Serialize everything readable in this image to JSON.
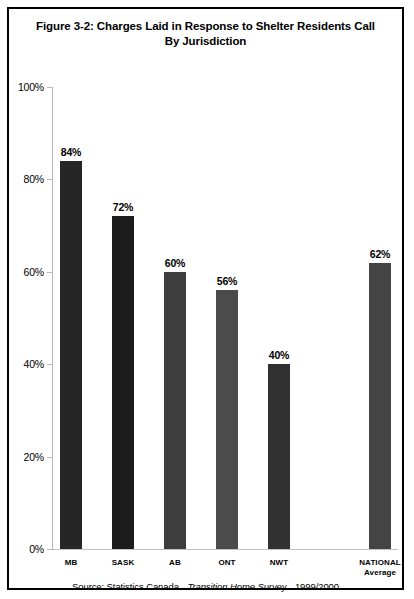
{
  "figure": {
    "title_line1": "Figure 3-2: Charges Laid in Response to Shelter Residents Call",
    "title_line2": "By Jurisdiction",
    "source_prefix": "Source: Statistics Canada",
    "source_italic": "Transition Home Survey",
    "source_year": "1999/2000",
    "frame_color": "#000000"
  },
  "chart_data": {
    "type": "bar",
    "title": "Figure 3-2: Charges Laid in Response to Shelter Residents Call By Jurisdiction",
    "xlabel": "",
    "ylabel": "",
    "ylim": [
      0,
      100
    ],
    "grid": false,
    "legend": "none",
    "unit": "%",
    "categories": [
      "MB",
      "SASK",
      "AB",
      "ONT",
      "NWT",
      "NATIONAL Average"
    ],
    "values": [
      84,
      72,
      60,
      56,
      40,
      62
    ],
    "value_labels": [
      "84%",
      "72%",
      "60%",
      "56%",
      "40%",
      "62%"
    ],
    "ytick_labels": [
      "100%",
      "80%",
      "60%",
      "40%",
      "20%",
      "0%"
    ],
    "ytick_values": [
      100,
      80,
      60,
      40,
      20,
      0
    ],
    "bars": [
      {
        "category": "MB",
        "cat_line1": "MB",
        "cat_line2": "",
        "value": 84,
        "label": "84%",
        "color": "#262626"
      },
      {
        "category": "SASK",
        "cat_line1": "SASK",
        "cat_line2": "",
        "value": 72,
        "label": "72%",
        "color": "#1c1c1c"
      },
      {
        "category": "AB",
        "cat_line1": "AB",
        "cat_line2": "",
        "value": 60,
        "label": "60%",
        "color": "#3d3d3d"
      },
      {
        "category": "ONT",
        "cat_line1": "ONT",
        "cat_line2": "",
        "value": 56,
        "label": "56%",
        "color": "#4b4b4b"
      },
      {
        "category": "NWT",
        "cat_line1": "NWT",
        "cat_line2": "",
        "value": 40,
        "label": "40%",
        "color": "#313131"
      },
      {
        "category": "NATIONAL Average",
        "cat_line1": "NATIONAL",
        "cat_line2": "Average",
        "value": 62,
        "label": "62%",
        "color": "#444444"
      }
    ]
  }
}
